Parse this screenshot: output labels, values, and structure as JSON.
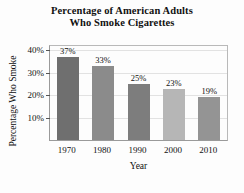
{
  "chart_data": {
    "type": "bar",
    "title": "Percentage of American Adults Who Smoke Cigarettes",
    "title_lines": [
      "Percentage of American Adults",
      "Who Smoke Cigarettes"
    ],
    "xlabel": "Year",
    "ylabel": "Percentage Who Smoke",
    "categories": [
      "1970",
      "1980",
      "1990",
      "2000",
      "2010"
    ],
    "values": [
      37,
      33,
      25,
      23,
      19
    ],
    "value_labels": [
      "37%",
      "33%",
      "25%",
      "23%",
      "19%"
    ],
    "ylim": [
      0,
      42
    ],
    "yticks": [
      10,
      20,
      30,
      40
    ],
    "ytick_labels": [
      "10%",
      "20%",
      "30%",
      "40%"
    ],
    "grid": true,
    "legend": "none",
    "bar_colors": [
      "#6f6f6f",
      "#8b8b8b",
      "#7d7d7d",
      "#b6b6b6",
      "#949494"
    ],
    "axis_color": "#9a9a9a",
    "grid_color": "#e2e2e2",
    "background": "#fdfdfd"
  }
}
